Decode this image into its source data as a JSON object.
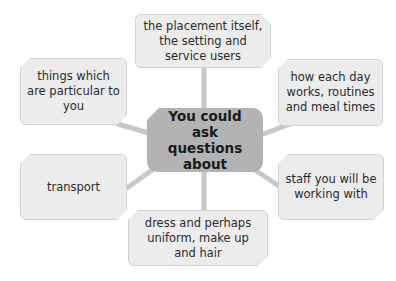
{
  "diagram": {
    "type": "mind-map",
    "center": {
      "label": "You could ask questions about"
    },
    "branches": [
      {
        "id": "placement",
        "label": "the placement itself, the setting and service users"
      },
      {
        "id": "daily",
        "label": "how each day works, routines and meal times"
      },
      {
        "id": "staff",
        "label": "staff you will be working with"
      },
      {
        "id": "dress",
        "label": "dress and perhaps uniform, make up and hair"
      },
      {
        "id": "transport",
        "label": "transport"
      },
      {
        "id": "personal",
        "label": "things which are particular to you"
      }
    ],
    "colors": {
      "center_fill": "#b3b3b3",
      "branch_fill": "#ececec",
      "branch_border": "#d2d2d2",
      "connector": "#c8c8c8",
      "text": "#2b2b2b"
    }
  }
}
